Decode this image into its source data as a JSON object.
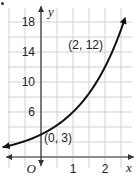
{
  "chart_data": {
    "type": "line",
    "title": "",
    "xlabel": "x",
    "ylabel": "y",
    "origin_label": "O",
    "xlim": [
      -1.25,
      2.75
    ],
    "ylim": [
      -1.5,
      20
    ],
    "x_ticks": [
      1,
      2
    ],
    "x_tick_labels": [
      "1",
      "2"
    ],
    "y_ticks": [
      6,
      10,
      14,
      18
    ],
    "y_tick_labels": [
      "6",
      "10",
      "14",
      "18"
    ],
    "grid": true,
    "grid_x_step": 0.5,
    "grid_y_step": 2,
    "function": "y = 3 * 2^x",
    "series": [
      {
        "name": "exponential curve",
        "x": [
          -1.2,
          -1,
          -0.5,
          0,
          0.5,
          1,
          1.5,
          2,
          2.5
        ],
        "y": [
          1.31,
          1.5,
          2.12,
          3,
          4.24,
          6,
          8.49,
          12,
          16.97
        ]
      }
    ],
    "annotations": [
      {
        "label": "(0, 3)",
        "x": 0,
        "y": 3
      },
      {
        "label": "(2, 12)",
        "x": 2,
        "y": 12
      }
    ],
    "colors": {
      "curve": "#111111",
      "axis": "#333333",
      "grid": "#d0d0d0"
    }
  }
}
